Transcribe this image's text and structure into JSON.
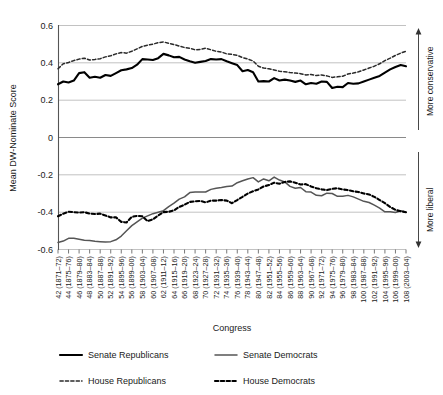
{
  "chart_data": {
    "type": "line",
    "title": "",
    "xlabel": "Congress",
    "ylabel": "Mean DW-Nominate Score",
    "ylim": [
      -0.6,
      0.6
    ],
    "yticks": [
      0.6,
      0.4,
      0.2,
      0,
      -0.2,
      -0.4,
      -0.6
    ],
    "ytick_labels": [
      "0.6",
      "0.4",
      "0.2",
      "0",
      "-0.2",
      "-0.4",
      "-0.6"
    ],
    "grid": true,
    "legend_position": "bottom",
    "annotations": [
      {
        "text": "More conservative",
        "position": "right-upper",
        "arrow": "up"
      },
      {
        "text": "More liberal",
        "position": "right-lower",
        "arrow": "down"
      }
    ],
    "categories": [
      "42 (1871-72)",
      "43 (1873-74)",
      "44 (1875-76)",
      "45 (1877-78)",
      "46 (1879-80)",
      "47 (1881-82)",
      "48 (1883-84)",
      "49 (1885-86)",
      "50 (1887-88)",
      "51 (1889-90)",
      "52 (1891-92)",
      "53 (1893-94)",
      "54 (1895-96)",
      "55 (1897-98)",
      "56 (1899-00)",
      "57 (1901-02)",
      "58 (1903-04)",
      "59 (1905-06)",
      "60 (1907-08)",
      "61 (1909-10)",
      "62 (1911-12)",
      "63 (1913-14)",
      "64 (1915-16)",
      "65 (1917-18)",
      "66 (1919-20)",
      "67 (1921-22)",
      "68 (1923-24)",
      "69 (1925-26)",
      "70 (1927-28)",
      "71 (1929-30)",
      "72 (1931-32)",
      "73 (1933-34)",
      "74 (1935-36)",
      "75 (1937-38)",
      "76 (1939-40)",
      "77 (1941-42)",
      "78 (1943-44)",
      "79 (1945-46)",
      "80 (1947-48)",
      "81 (1949-50)",
      "82 (1951-52)",
      "83 (1953-54)",
      "84 (1955-56)",
      "85 (1957-58)",
      "86 (1959-60)",
      "87 (1961-62)",
      "88 (1963-64)",
      "89 (1965-66)",
      "90 (1967-68)",
      "91 (1969-70)",
      "92 (1971-72)",
      "93 (1973-74)",
      "94 (1975-76)",
      "95 (1977-78)",
      "96 (1979-80)",
      "97 (1981-82)",
      "98 (1983-84)",
      "99 (1985-86)",
      "100 (1987-88)",
      "101 (1989-90)",
      "102 (1991-92)",
      "103 (1993-94)",
      "104 (1995-96)",
      "105 (1997-98)",
      "106 (1999-00)",
      "107 (2001-02)",
      "108 (2003-04)"
    ],
    "xtick_labels": [
      "42 (1871–72)",
      "44 (1875–76)",
      "46 (1879–80)",
      "48 (1883–84)",
      "50 (1887–88)",
      "52 (1891–92)",
      "54 (1895–96)",
      "56 (1899–00)",
      "58 (1903–04)",
      "60 (1907–08)",
      "62 (1911–12)",
      "64 (1915–16)",
      "66 (1919–20)",
      "68 (1923–24)",
      "70 (1927–28)",
      "72 (1931–32)",
      "74 (1935–36)",
      "76 (1939–40)",
      "78 (1943–44)",
      "80 (1947–48)",
      "82 (1951–52)",
      "84 (1955–56)",
      "86 (1959–60)",
      "88 (1963–64)",
      "90 (1967–68)",
      "92 (1971–72)",
      "94 (1975–76)",
      "96 (1979–80)",
      "98 (1983–84)",
      "100 (1987–88)",
      "102 (1991–92)",
      "104 (1995–96)",
      "106 (1999–00)",
      "108 (2003–04)"
    ],
    "series": [
      {
        "name": "Senate Republicans",
        "style": "solid-thick-black",
        "color": "#000000",
        "values": [
          0.285,
          0.3,
          0.295,
          0.305,
          0.345,
          0.35,
          0.32,
          0.325,
          0.32,
          0.335,
          0.33,
          0.345,
          0.36,
          0.365,
          0.372,
          0.39,
          0.42,
          0.418,
          0.415,
          0.425,
          0.448,
          0.44,
          0.43,
          0.432,
          0.418,
          0.408,
          0.4,
          0.405,
          0.41,
          0.42,
          0.418,
          0.42,
          0.408,
          0.398,
          0.388,
          0.355,
          0.362,
          0.35,
          0.3,
          0.302,
          0.3,
          0.318,
          0.305,
          0.31,
          0.305,
          0.298,
          0.305,
          0.285,
          0.292,
          0.288,
          0.3,
          0.298,
          0.265,
          0.272,
          0.27,
          0.292,
          0.288,
          0.29,
          0.3,
          0.31,
          0.32,
          0.33,
          0.348,
          0.365,
          0.378,
          0.388,
          0.382
        ]
      },
      {
        "name": "House Republicans",
        "style": "dashed-thin",
        "color": "#2a2a2a",
        "values": [
          0.368,
          0.395,
          0.402,
          0.412,
          0.42,
          0.425,
          0.415,
          0.418,
          0.422,
          0.432,
          0.438,
          0.448,
          0.455,
          0.452,
          0.462,
          0.475,
          0.488,
          0.495,
          0.5,
          0.508,
          0.512,
          0.505,
          0.498,
          0.49,
          0.482,
          0.478,
          0.47,
          0.472,
          0.478,
          0.47,
          0.462,
          0.458,
          0.448,
          0.445,
          0.44,
          0.428,
          0.42,
          0.41,
          0.382,
          0.372,
          0.368,
          0.362,
          0.355,
          0.352,
          0.348,
          0.345,
          0.342,
          0.335,
          0.338,
          0.332,
          0.335,
          0.33,
          0.322,
          0.325,
          0.328,
          0.34,
          0.345,
          0.352,
          0.362,
          0.372,
          0.382,
          0.395,
          0.412,
          0.425,
          0.44,
          0.452,
          0.462
        ]
      },
      {
        "name": "Senate Democrats",
        "style": "solid-thin-gray",
        "color": "#555555",
        "values": [
          -0.562,
          -0.555,
          -0.54,
          -0.54,
          -0.545,
          -0.55,
          -0.552,
          -0.556,
          -0.558,
          -0.56,
          -0.558,
          -0.548,
          -0.528,
          -0.5,
          -0.472,
          -0.452,
          -0.432,
          -0.42,
          -0.408,
          -0.4,
          -0.392,
          -0.37,
          -0.352,
          -0.33,
          -0.318,
          -0.295,
          -0.292,
          -0.292,
          -0.292,
          -0.278,
          -0.272,
          -0.268,
          -0.262,
          -0.26,
          -0.242,
          -0.232,
          -0.222,
          -0.215,
          -0.238,
          -0.222,
          -0.232,
          -0.212,
          -0.228,
          -0.238,
          -0.262,
          -0.272,
          -0.268,
          -0.29,
          -0.292,
          -0.31,
          -0.312,
          -0.298,
          -0.3,
          -0.315,
          -0.315,
          -0.31,
          -0.318,
          -0.33,
          -0.342,
          -0.348,
          -0.362,
          -0.378,
          -0.398,
          -0.398,
          -0.402,
          -0.392,
          -0.4
        ]
      },
      {
        "name": "House Democrats",
        "style": "dashed-thick",
        "color": "#000000",
        "values": [
          -0.422,
          -0.408,
          -0.398,
          -0.4,
          -0.402,
          -0.4,
          -0.408,
          -0.41,
          -0.408,
          -0.418,
          -0.428,
          -0.428,
          -0.452,
          -0.455,
          -0.425,
          -0.42,
          -0.422,
          -0.448,
          -0.438,
          -0.418,
          -0.4,
          -0.398,
          -0.39,
          -0.372,
          -0.36,
          -0.345,
          -0.342,
          -0.34,
          -0.348,
          -0.338,
          -0.338,
          -0.335,
          -0.338,
          -0.352,
          -0.335,
          -0.318,
          -0.3,
          -0.288,
          -0.278,
          -0.262,
          -0.255,
          -0.242,
          -0.248,
          -0.238,
          -0.235,
          -0.242,
          -0.252,
          -0.25,
          -0.262,
          -0.272,
          -0.278,
          -0.282,
          -0.275,
          -0.272,
          -0.278,
          -0.282,
          -0.288,
          -0.292,
          -0.3,
          -0.305,
          -0.318,
          -0.335,
          -0.352,
          -0.372,
          -0.388,
          -0.395,
          -0.4
        ]
      }
    ]
  },
  "legend": {
    "items": [
      {
        "label": "Senate Republicans",
        "style": "solid-thick-black"
      },
      {
        "label": "Senate Democrats",
        "style": "solid-thin-gray"
      },
      {
        "label": "House Republicans",
        "style": "dashed-thin"
      },
      {
        "label": "House Democrats",
        "style": "dashed-thick"
      }
    ]
  }
}
